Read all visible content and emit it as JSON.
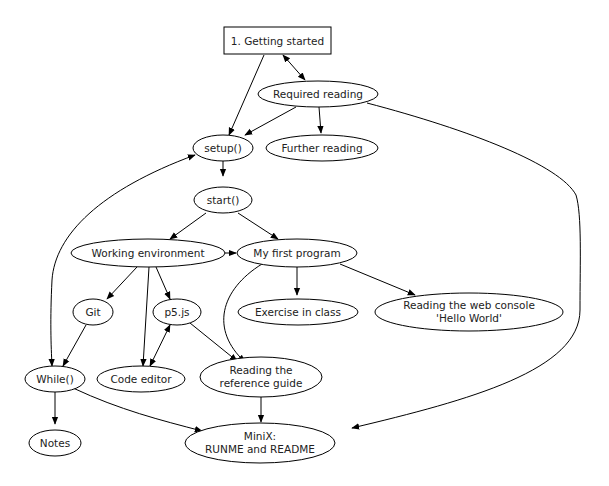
{
  "diagram": {
    "type": "directed-graph",
    "nodes": {
      "getting_started": {
        "label": "1. Getting started",
        "shape": "box"
      },
      "required_reading": {
        "label": "Required reading",
        "shape": "ellipse"
      },
      "setup": {
        "label": "setup()",
        "shape": "ellipse"
      },
      "further_reading": {
        "label": "Further reading",
        "shape": "ellipse"
      },
      "start": {
        "label": "start()",
        "shape": "ellipse"
      },
      "working_environment": {
        "label": "Working environment",
        "shape": "ellipse"
      },
      "my_first_program": {
        "label": "My first program",
        "shape": "ellipse"
      },
      "git": {
        "label": "Git",
        "shape": "ellipse"
      },
      "p5js": {
        "label": "p5.js",
        "shape": "ellipse"
      },
      "exercise_in_class": {
        "label": "Exercise in class",
        "shape": "ellipse"
      },
      "web_console": {
        "label_line1": "Reading the web console",
        "label_line2": "'Hello World'",
        "shape": "ellipse"
      },
      "while": {
        "label": "While()",
        "shape": "ellipse"
      },
      "code_editor": {
        "label": "Code editor",
        "shape": "ellipse"
      },
      "reference_guide": {
        "label_line1": "Reading the",
        "label_line2": "reference guide",
        "shape": "ellipse"
      },
      "notes": {
        "label": "Notes",
        "shape": "ellipse"
      },
      "minix": {
        "label_line1": "MiniX:",
        "label_line2": "RUNME and README",
        "shape": "ellipse"
      }
    },
    "edges": [
      {
        "from": "getting_started",
        "to": "required_reading",
        "dir": "both"
      },
      {
        "from": "getting_started",
        "to": "setup",
        "dir": "forward"
      },
      {
        "from": "required_reading",
        "to": "setup",
        "dir": "forward"
      },
      {
        "from": "required_reading",
        "to": "further_reading",
        "dir": "forward"
      },
      {
        "from": "required_reading",
        "to": "minix",
        "dir": "forward"
      },
      {
        "from": "setup",
        "to": "start",
        "dir": "forward"
      },
      {
        "from": "setup",
        "to": "while",
        "dir": "both"
      },
      {
        "from": "start",
        "to": "working_environment",
        "dir": "forward"
      },
      {
        "from": "start",
        "to": "my_first_program",
        "dir": "forward"
      },
      {
        "from": "working_environment",
        "to": "my_first_program",
        "dir": "forward"
      },
      {
        "from": "working_environment",
        "to": "git",
        "dir": "forward"
      },
      {
        "from": "working_environment",
        "to": "code_editor",
        "dir": "forward"
      },
      {
        "from": "working_environment",
        "to": "p5js",
        "dir": "forward"
      },
      {
        "from": "my_first_program",
        "to": "exercise_in_class",
        "dir": "forward"
      },
      {
        "from": "my_first_program",
        "to": "web_console",
        "dir": "forward"
      },
      {
        "from": "my_first_program",
        "to": "reference_guide",
        "dir": "forward"
      },
      {
        "from": "git",
        "to": "while",
        "dir": "forward"
      },
      {
        "from": "p5js",
        "to": "code_editor",
        "dir": "both"
      },
      {
        "from": "p5js",
        "to": "reference_guide",
        "dir": "forward"
      },
      {
        "from": "while",
        "to": "notes",
        "dir": "forward"
      },
      {
        "from": "while",
        "to": "minix",
        "dir": "forward"
      },
      {
        "from": "reference_guide",
        "to": "minix",
        "dir": "forward"
      }
    ]
  }
}
